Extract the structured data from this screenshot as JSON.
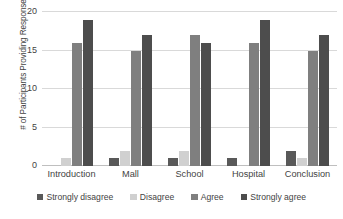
{
  "chart_data": {
    "type": "bar",
    "title": "",
    "xlabel": "",
    "ylabel": "# of Participants Providing Response",
    "ylim": [
      0,
      20
    ],
    "yticks": [
      0,
      5,
      10,
      15,
      20
    ],
    "grid": true,
    "legend_position": "bottom",
    "categories": [
      "Introduction",
      "Mall",
      "School",
      "Hospital",
      "Conclusion"
    ],
    "series": [
      {
        "name": "Strongly disagree",
        "color": "#595959",
        "values": [
          0,
          1,
          1,
          1,
          2
        ]
      },
      {
        "name": "Disagree",
        "color": "#d0d0d0",
        "values": [
          1,
          2,
          2,
          0,
          1
        ]
      },
      {
        "name": "Agree",
        "color": "#7f7f7f",
        "values": [
          16,
          15,
          17,
          16,
          15
        ]
      },
      {
        "name": "Strongly agree",
        "color": "#4d4d4d",
        "values": [
          19,
          17,
          16,
          19,
          17
        ]
      }
    ]
  }
}
